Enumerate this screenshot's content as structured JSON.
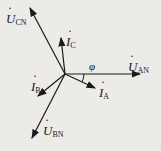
{
  "diagram": {
    "type": "phasor",
    "origin": [
      65,
      74
    ],
    "phasors": [
      {
        "name": "U_AN",
        "label": "U",
        "sub": "AN",
        "end": [
          140,
          74
        ]
      },
      {
        "name": "U_BN",
        "label": "U",
        "sub": "BN",
        "end": [
          32,
          138
        ]
      },
      {
        "name": "U_CN",
        "label": "U",
        "sub": "CN",
        "end": [
          30,
          8
        ]
      },
      {
        "name": "I_A",
        "label": "I",
        "sub": "A",
        "end": [
          95,
          88
        ]
      },
      {
        "name": "I_B",
        "label": "I",
        "sub": "B",
        "end": [
          38,
          96
        ]
      },
      {
        "name": "I_C",
        "label": "I",
        "sub": "C",
        "end": [
          61,
          38
        ]
      }
    ],
    "angle_label": "φ",
    "colors": {
      "line": "#1a1a1a",
      "background": "#ecebe8"
    }
  }
}
